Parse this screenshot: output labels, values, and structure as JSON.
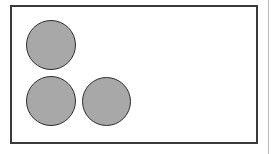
{
  "figure": {
    "type": "shape-diagram",
    "canvas": {
      "width": 272,
      "height": 154,
      "background_color": "#ffffff"
    },
    "frame": {
      "name": "figure-frame",
      "shape": "rectangle",
      "x": 10,
      "y": 5,
      "width": 248,
      "height": 139,
      "fill_color": "#ffffff",
      "stroke_color": "#3a3a3a",
      "stroke_width": 2
    },
    "artifact": {
      "name": "page-edge-line",
      "x": 268,
      "width": 1,
      "color": "#b9b9b9"
    },
    "shape_count": 3,
    "shapes": [
      {
        "id": "circle-1",
        "label": "top-left-circle",
        "type": "circle",
        "center_x": 51,
        "center_y": 45,
        "diameter": 50,
        "radius": 25,
        "fill_color": "#a8a8a8",
        "stroke_color": "#2e2e2e",
        "stroke_width": 1
      },
      {
        "id": "circle-2",
        "label": "bottom-left-circle",
        "type": "circle",
        "center_x": 51,
        "center_y": 101,
        "diameter": 50,
        "radius": 25,
        "fill_color": "#a8a8a8",
        "stroke_color": "#2e2e2e",
        "stroke_width": 1
      },
      {
        "id": "circle-3",
        "label": "bottom-middle-circle",
        "type": "circle",
        "center_x": 106,
        "center_y": 101,
        "diameter": 49,
        "radius": 24.5,
        "fill_color": "#a8a8a8",
        "stroke_color": "#2e2e2e",
        "stroke_width": 1
      }
    ]
  }
}
